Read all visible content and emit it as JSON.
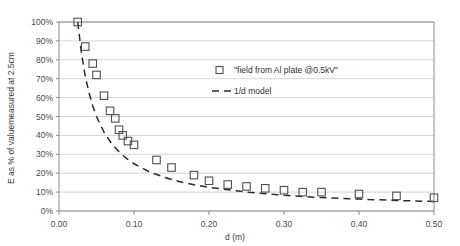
{
  "chart_data": {
    "type": "scatter",
    "title": "",
    "xlabel": "d (m)",
    "ylabel": "E as % of valuemeasured at 2.5cm",
    "xlim": [
      0,
      0.5
    ],
    "ylim": [
      0,
      1.0
    ],
    "grid": true,
    "legend_position": "upper-right-inside",
    "x_ticks": [
      "0.00",
      "0.10",
      "0.20",
      "0.30",
      "0.40",
      "0.50"
    ],
    "x_tick_values": [
      0.0,
      0.1,
      0.2,
      0.3,
      0.4,
      0.5
    ],
    "y_ticks": [
      "0%",
      "10%",
      "20%",
      "30%",
      "40%",
      "50%",
      "60%",
      "70%",
      "80%",
      "90%",
      "100%"
    ],
    "y_tick_values": [
      0,
      10,
      20,
      30,
      40,
      50,
      60,
      70,
      80,
      90,
      100
    ],
    "series": [
      {
        "name": "\"field from Al plate @0.5kV\"",
        "marker": "open-square",
        "x": [
          0.025,
          0.035,
          0.045,
          0.05,
          0.06,
          0.068,
          0.075,
          0.08,
          0.085,
          0.092,
          0.1,
          0.13,
          0.15,
          0.18,
          0.2,
          0.225,
          0.25,
          0.275,
          0.3,
          0.325,
          0.35,
          0.4,
          0.45,
          0.5
        ],
        "values": [
          100,
          87,
          78,
          72,
          61,
          53,
          49,
          43,
          40,
          37,
          35,
          27,
          23,
          19,
          16,
          14,
          13,
          12,
          11,
          10,
          10,
          9,
          8,
          7
        ]
      },
      {
        "name": "1/d model",
        "marker": "dashed-line",
        "x": [
          0.025,
          0.03,
          0.035,
          0.04,
          0.045,
          0.05,
          0.06,
          0.07,
          0.08,
          0.09,
          0.1,
          0.12,
          0.14,
          0.16,
          0.18,
          0.2,
          0.25,
          0.3,
          0.35,
          0.4,
          0.45,
          0.5
        ],
        "values": [
          100,
          83.3,
          71.4,
          62.5,
          55.6,
          50.0,
          41.7,
          35.7,
          31.3,
          27.8,
          25.0,
          20.8,
          17.9,
          15.6,
          13.9,
          12.5,
          10.0,
          8.3,
          7.1,
          6.3,
          5.6,
          5.0
        ]
      }
    ]
  },
  "legend": {
    "entries": [
      {
        "label": "\"field from Al plate @0.5kV\"",
        "type": "open-square"
      },
      {
        "label": "1/d model",
        "type": "dashed-line"
      }
    ]
  }
}
